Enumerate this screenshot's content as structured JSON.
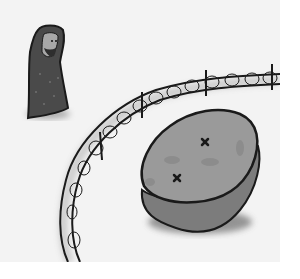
{
  "scene": {
    "description": "Hand-drawn grayscale illustration",
    "elements": [
      "hooded-figure",
      "barbed-wire-fence",
      "large-stone"
    ],
    "colors": {
      "background": "#f3f3f3",
      "outline": "#1a1a1a",
      "figure_cloak": "#4a4a4a",
      "figure_face": "#a8a8a8",
      "stone_top": "#9a9a9a",
      "stone_side": "#7c7c7c",
      "shadow": "#6a6a6a"
    }
  }
}
